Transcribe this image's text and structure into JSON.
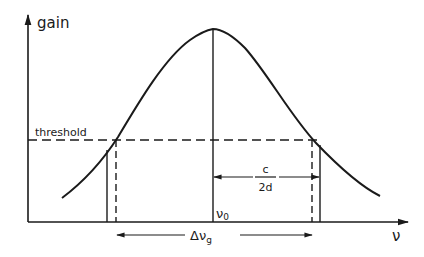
{
  "diagram": {
    "y_axis_label": "gain",
    "x_axis_label": "ν",
    "threshold_label": "threshold",
    "center_label": "ν",
    "center_subscript": "0",
    "mode_spacing_numerator": "c",
    "mode_spacing_denominator": "2d",
    "bandwidth_label": "Δν",
    "bandwidth_subscript": "g",
    "colors": {
      "ink": "#1a1a1a",
      "background": "#ffffff"
    }
  }
}
